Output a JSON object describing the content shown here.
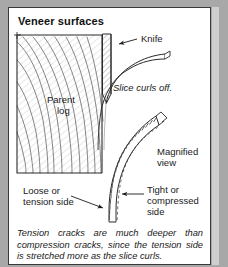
{
  "figure": {
    "title": "Veneer surfaces",
    "caption": "Tension cracks are much deeper than compression cracks, since the tension side is stretched more as the slice curls."
  },
  "labels": {
    "knife": "Knife",
    "parent_log_line1": "Parent",
    "parent_log_line2": "log",
    "slice_curls_off": "Slice curls off.",
    "magnified_view_line1": "Magnified",
    "magnified_view_line2": "view",
    "loose_side_line1": "Loose or",
    "loose_side_line2": "tension side",
    "tight_side_line1": "Tight or",
    "tight_side_line2": "compressed",
    "tight_side_line3": "side"
  },
  "colors": {
    "background": "#a8a8a8",
    "panel": "#ffffff",
    "border": "#3a3a3a",
    "ink": "#1a1a1a",
    "grain": "#6f6f6f",
    "hatch": "#555555"
  }
}
